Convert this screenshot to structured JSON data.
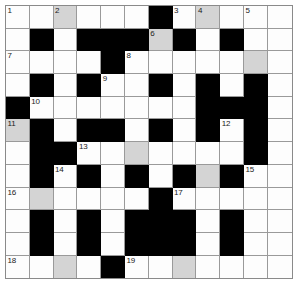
{
  "puzzle": {
    "type": "crossword-grid",
    "rows": 12,
    "cols": 12,
    "colors": {
      "open_cell": "#fdfdfd",
      "shaded_cell": "#d4d4d4",
      "block_cell": "#000000",
      "grid_line": "#9a9a9a",
      "number_text": "#1a1a1a",
      "page_background": "#ffffff"
    },
    "legend": {
      "open": "empty answer square",
      "shaded": "highlighted answer square",
      "block": "blocked square"
    },
    "cells": [
      [
        {
          "state": "open",
          "number": "1"
        },
        {
          "state": "open",
          "number": ""
        },
        {
          "state": "shaded",
          "number": "2"
        },
        {
          "state": "open",
          "number": ""
        },
        {
          "state": "open",
          "number": ""
        },
        {
          "state": "open",
          "number": ""
        },
        {
          "state": "block",
          "number": ""
        },
        {
          "state": "open",
          "number": "3"
        },
        {
          "state": "shaded",
          "number": "4"
        },
        {
          "state": "open",
          "number": ""
        },
        {
          "state": "open",
          "number": "5"
        },
        {
          "state": "open",
          "number": ""
        }
      ],
      [
        {
          "state": "open",
          "number": ""
        },
        {
          "state": "block",
          "number": ""
        },
        {
          "state": "open",
          "number": ""
        },
        {
          "state": "block",
          "number": ""
        },
        {
          "state": "block",
          "number": ""
        },
        {
          "state": "block",
          "number": ""
        },
        {
          "state": "shaded",
          "number": "6"
        },
        {
          "state": "block",
          "number": ""
        },
        {
          "state": "open",
          "number": ""
        },
        {
          "state": "block",
          "number": ""
        },
        {
          "state": "open",
          "number": ""
        },
        {
          "state": "open",
          "number": ""
        }
      ],
      [
        {
          "state": "open",
          "number": "7"
        },
        {
          "state": "open",
          "number": ""
        },
        {
          "state": "open",
          "number": ""
        },
        {
          "state": "open",
          "number": ""
        },
        {
          "state": "block",
          "number": ""
        },
        {
          "state": "open",
          "number": "8"
        },
        {
          "state": "open",
          "number": ""
        },
        {
          "state": "open",
          "number": ""
        },
        {
          "state": "open",
          "number": ""
        },
        {
          "state": "open",
          "number": ""
        },
        {
          "state": "shaded",
          "number": ""
        },
        {
          "state": "open",
          "number": ""
        }
      ],
      [
        {
          "state": "open",
          "number": ""
        },
        {
          "state": "block",
          "number": ""
        },
        {
          "state": "open",
          "number": ""
        },
        {
          "state": "block",
          "number": ""
        },
        {
          "state": "open",
          "number": "9"
        },
        {
          "state": "open",
          "number": ""
        },
        {
          "state": "block",
          "number": ""
        },
        {
          "state": "open",
          "number": ""
        },
        {
          "state": "block",
          "number": ""
        },
        {
          "state": "open",
          "number": ""
        },
        {
          "state": "block",
          "number": ""
        },
        {
          "state": "open",
          "number": ""
        }
      ],
      [
        {
          "state": "block",
          "number": ""
        },
        {
          "state": "open",
          "number": "10"
        },
        {
          "state": "open",
          "number": ""
        },
        {
          "state": "open",
          "number": ""
        },
        {
          "state": "open",
          "number": ""
        },
        {
          "state": "open",
          "number": ""
        },
        {
          "state": "open",
          "number": ""
        },
        {
          "state": "open",
          "number": ""
        },
        {
          "state": "block",
          "number": ""
        },
        {
          "state": "block",
          "number": ""
        },
        {
          "state": "block",
          "number": ""
        },
        {
          "state": "open",
          "number": ""
        }
      ],
      [
        {
          "state": "shaded",
          "number": "11"
        },
        {
          "state": "block",
          "number": ""
        },
        {
          "state": "open",
          "number": ""
        },
        {
          "state": "block",
          "number": ""
        },
        {
          "state": "block",
          "number": ""
        },
        {
          "state": "open",
          "number": ""
        },
        {
          "state": "block",
          "number": ""
        },
        {
          "state": "open",
          "number": ""
        },
        {
          "state": "block",
          "number": ""
        },
        {
          "state": "open",
          "number": "12"
        },
        {
          "state": "block",
          "number": ""
        },
        {
          "state": "open",
          "number": ""
        }
      ],
      [
        {
          "state": "open",
          "number": ""
        },
        {
          "state": "block",
          "number": ""
        },
        {
          "state": "block",
          "number": ""
        },
        {
          "state": "open",
          "number": "13"
        },
        {
          "state": "open",
          "number": ""
        },
        {
          "state": "shaded",
          "number": ""
        },
        {
          "state": "open",
          "number": ""
        },
        {
          "state": "open",
          "number": ""
        },
        {
          "state": "open",
          "number": ""
        },
        {
          "state": "open",
          "number": ""
        },
        {
          "state": "block",
          "number": ""
        },
        {
          "state": "open",
          "number": ""
        }
      ],
      [
        {
          "state": "open",
          "number": ""
        },
        {
          "state": "block",
          "number": ""
        },
        {
          "state": "open",
          "number": "14"
        },
        {
          "state": "block",
          "number": ""
        },
        {
          "state": "open",
          "number": ""
        },
        {
          "state": "block",
          "number": ""
        },
        {
          "state": "open",
          "number": ""
        },
        {
          "state": "block",
          "number": ""
        },
        {
          "state": "shaded",
          "number": ""
        },
        {
          "state": "block",
          "number": ""
        },
        {
          "state": "open",
          "number": "15"
        },
        {
          "state": "open",
          "number": ""
        }
      ],
      [
        {
          "state": "open",
          "number": "16"
        },
        {
          "state": "shaded",
          "number": ""
        },
        {
          "state": "open",
          "number": ""
        },
        {
          "state": "open",
          "number": ""
        },
        {
          "state": "open",
          "number": ""
        },
        {
          "state": "open",
          "number": ""
        },
        {
          "state": "block",
          "number": ""
        },
        {
          "state": "open",
          "number": "17"
        },
        {
          "state": "open",
          "number": ""
        },
        {
          "state": "open",
          "number": ""
        },
        {
          "state": "open",
          "number": ""
        },
        {
          "state": "open",
          "number": ""
        }
      ],
      [
        {
          "state": "open",
          "number": ""
        },
        {
          "state": "block",
          "number": ""
        },
        {
          "state": "open",
          "number": ""
        },
        {
          "state": "block",
          "number": ""
        },
        {
          "state": "open",
          "number": ""
        },
        {
          "state": "block",
          "number": ""
        },
        {
          "state": "block",
          "number": ""
        },
        {
          "state": "block",
          "number": ""
        },
        {
          "state": "open",
          "number": ""
        },
        {
          "state": "block",
          "number": ""
        },
        {
          "state": "open",
          "number": ""
        },
        {
          "state": "open",
          "number": ""
        }
      ],
      [
        {
          "state": "open",
          "number": ""
        },
        {
          "state": "block",
          "number": ""
        },
        {
          "state": "open",
          "number": ""
        },
        {
          "state": "block",
          "number": ""
        },
        {
          "state": "open",
          "number": ""
        },
        {
          "state": "block",
          "number": ""
        },
        {
          "state": "block",
          "number": ""
        },
        {
          "state": "block",
          "number": ""
        },
        {
          "state": "open",
          "number": ""
        },
        {
          "state": "block",
          "number": ""
        },
        {
          "state": "open",
          "number": ""
        },
        {
          "state": "open",
          "number": ""
        }
      ],
      [
        {
          "state": "open",
          "number": "18"
        },
        {
          "state": "open",
          "number": ""
        },
        {
          "state": "shaded",
          "number": ""
        },
        {
          "state": "open",
          "number": ""
        },
        {
          "state": "block",
          "number": ""
        },
        {
          "state": "open",
          "number": "19"
        },
        {
          "state": "open",
          "number": ""
        },
        {
          "state": "shaded",
          "number": ""
        },
        {
          "state": "open",
          "number": ""
        },
        {
          "state": "open",
          "number": ""
        },
        {
          "state": "open",
          "number": ""
        },
        {
          "state": "open",
          "number": ""
        }
      ]
    ],
    "clue_numbers": [
      "1",
      "2",
      "3",
      "4",
      "5",
      "6",
      "7",
      "8",
      "9",
      "10",
      "11",
      "12",
      "13",
      "14",
      "15",
      "16",
      "17",
      "18",
      "19"
    ]
  }
}
